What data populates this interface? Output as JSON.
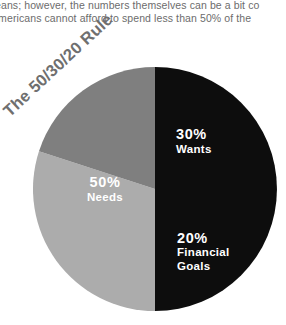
{
  "body_text": {
    "line1": "eans; however, the numbers themselves can be a bit co",
    "line2": "Americans cannot afford to spend less than 50% of the"
  },
  "chart_data": {
    "type": "pie",
    "title": "The 50/30/20 Rule",
    "xlabel": "",
    "ylabel": "",
    "grid": false,
    "legend_position": "inside-slices",
    "start_angle_deg": 0,
    "direction": "clockwise",
    "slices": [
      {
        "label": "Needs",
        "value": 50,
        "value_label": "50%",
        "color": "#0d0d0d",
        "text_color": "#ffffff"
      },
      {
        "label": "Wants",
        "value": 30,
        "value_label": "30%",
        "color": "#acacac",
        "text_color": "#ffffff"
      },
      {
        "label": "Financial Goals",
        "value": 20,
        "value_label": "20%",
        "color": "#7f7f7f",
        "text_color": "#ffffff"
      }
    ],
    "annotations": [
      {
        "text": "50%",
        "slice": "Needs"
      },
      {
        "text": "Needs",
        "slice": "Needs"
      },
      {
        "text": "30%",
        "slice": "Wants"
      },
      {
        "text": "Wants",
        "slice": "Wants"
      },
      {
        "text": "20%",
        "slice": "Financial Goals"
      },
      {
        "text": "Financial",
        "slice": "Financial Goals"
      },
      {
        "text": "Goals",
        "slice": "Financial Goals"
      }
    ]
  },
  "labels": {
    "needs_pct": "50%",
    "needs_name": "Needs",
    "wants_pct": "30%",
    "wants_name": "Wants",
    "goals_pct": "20%",
    "goals_name_line1": "Financial",
    "goals_name_line2": "Goals"
  },
  "colors": {
    "background": "#ffffff",
    "body_text": "#6c6c6c",
    "title": "#6f6f6f",
    "needs": "#0d0d0d",
    "wants": "#acacac",
    "goals": "#7f7f7f"
  }
}
